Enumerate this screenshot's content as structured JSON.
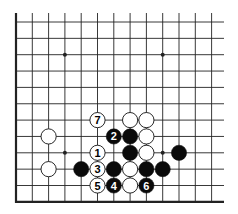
{
  "diagram": {
    "type": "go-board-diagram",
    "visible_area": "lower-left corner",
    "colors": {
      "line": "#222222",
      "black_stone": "#0a0a0a",
      "white_stone": "#ffffff",
      "background": "#ffffff"
    },
    "grid": {
      "origin_x": 16,
      "origin_y": 22,
      "spacing_x": 16.3,
      "spacing_y": 16.35,
      "cols": 13,
      "rows": 12,
      "extend_right": 224,
      "top_extend": 13
    },
    "star_points": [
      {
        "col": 3,
        "row": 2
      },
      {
        "col": 9,
        "row": 2
      },
      {
        "col": 3,
        "row": 8
      },
      {
        "col": 9,
        "row": 8
      }
    ],
    "stones": [
      {
        "col": 2,
        "row": 7,
        "color": "white",
        "label": ""
      },
      {
        "col": 2,
        "row": 9,
        "color": "white",
        "label": ""
      },
      {
        "col": 5,
        "row": 6,
        "color": "white",
        "label": "7"
      },
      {
        "col": 7,
        "row": 6,
        "color": "white",
        "label": ""
      },
      {
        "col": 8,
        "row": 6,
        "color": "white",
        "label": ""
      },
      {
        "col": 6,
        "row": 7,
        "color": "black",
        "label": "2"
      },
      {
        "col": 7,
        "row": 7,
        "color": "black",
        "label": ""
      },
      {
        "col": 8,
        "row": 7,
        "color": "white",
        "label": ""
      },
      {
        "col": 5,
        "row": 8,
        "color": "white",
        "label": "1"
      },
      {
        "col": 7,
        "row": 8,
        "color": "black",
        "label": ""
      },
      {
        "col": 8,
        "row": 8,
        "color": "white",
        "label": ""
      },
      {
        "col": 10,
        "row": 8,
        "color": "black",
        "label": ""
      },
      {
        "col": 4,
        "row": 9,
        "color": "black",
        "label": ""
      },
      {
        "col": 5,
        "row": 9,
        "color": "white",
        "label": "3"
      },
      {
        "col": 6,
        "row": 9,
        "color": "black",
        "label": ""
      },
      {
        "col": 7,
        "row": 9,
        "color": "white",
        "label": ""
      },
      {
        "col": 8,
        "row": 9,
        "color": "black",
        "label": ""
      },
      {
        "col": 9,
        "row": 9,
        "color": "black",
        "label": ""
      },
      {
        "col": 5,
        "row": 10,
        "color": "white",
        "label": "5"
      },
      {
        "col": 6,
        "row": 10,
        "color": "black",
        "label": "4"
      },
      {
        "col": 7,
        "row": 10,
        "color": "white",
        "label": ""
      },
      {
        "col": 8,
        "row": 10,
        "color": "black",
        "label": "6"
      }
    ]
  }
}
